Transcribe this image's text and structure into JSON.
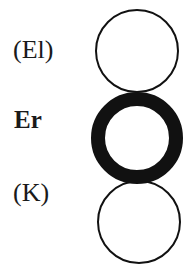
{
  "diagram": {
    "labels": {
      "top": "(El)",
      "middle": "Er",
      "bottom": "(K)"
    },
    "nodes": [
      {
        "id": "el",
        "label": "(El)",
        "style": "thin",
        "cx": 137,
        "cy": 51,
        "r": 41
      },
      {
        "id": "er",
        "label": "Er",
        "style": "thick",
        "cx": 137,
        "cy": 138,
        "r": 39
      },
      {
        "id": "k",
        "label": "(K)",
        "style": "thin",
        "cx": 139,
        "cy": 222,
        "r": 41
      }
    ],
    "colors": {
      "stroke": "#111111",
      "background": "#ffffff"
    }
  }
}
